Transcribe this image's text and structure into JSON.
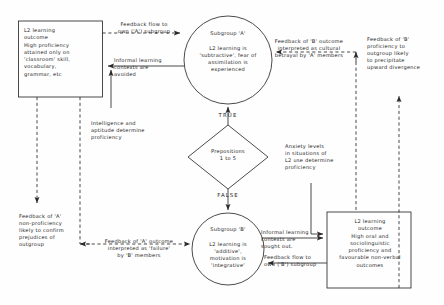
{
  "diagram": {
    "stroke_color": "#2a2a2a",
    "text_color": "#1d1d1d",
    "background": "#fefefe",
    "nodes": [
      {
        "id": "box-a-outcome",
        "shape": "rectangle",
        "name": "l2-learning-outcome-a-box",
        "text": "L2  learning\noutcome\nHigh proficiency\nattained only on\n'classroom' skill,\nvocabulary,\ngrammar, etc"
      },
      {
        "id": "circle-subgroup-a",
        "shape": "circle",
        "name": "subgroup-a-node",
        "text": "Subgroup 'A'\n\nL2  learning is\n'subtractive', fear of\nassimilation is\nexperienced"
      },
      {
        "id": "diamond-prepositions",
        "shape": "diamond",
        "name": "prepositions-decision-node",
        "text": "Prepositions\n1 to 5"
      },
      {
        "id": "circle-subgroup-b",
        "shape": "circle",
        "name": "subgroup-b-node",
        "text": "Subgroup 'B'\n\nL2 learning is\n'additive',\nmotivation is\n'integrative'"
      },
      {
        "id": "box-b-outcome",
        "shape": "rectangle",
        "name": "l2-learning-outcome-b-box",
        "text": "L2  learning\noutcome\nHigh oral and\nsociolinguistic\nproficiency  and\nfavourable non-verbal\noutcomes"
      }
    ],
    "decision_labels": {
      "true": "TRUE",
      "false": "FALSE"
    },
    "edge_labels": [
      {
        "id": "feedback-flow-a",
        "name": "edge-label-feedback-flow-a",
        "text": "Feedback flow to\nown ('A') subgroup"
      },
      {
        "id": "informal-avoided",
        "name": "edge-label-informal-learning-avoided",
        "text": "Informal learning\ncontexts are\navoided"
      },
      {
        "id": "intelligence-aptitude",
        "name": "edge-label-intelligence-aptitude",
        "text": "Intelligence and\naptitude determine\nproficiency"
      },
      {
        "id": "feedback-b-outcome",
        "name": "edge-label-feedback-b-outcome",
        "text": "Feedback of 'B' outcome\ninterpreted as cultural\nbetrayal by 'A' members"
      },
      {
        "id": "feedback-b-proficiency",
        "name": "edge-label-feedback-b-proficiency",
        "text": "Feedback of 'B'\nproficiency to\noutgroup likely\nto precipitate\nupward divergence"
      },
      {
        "id": "anxiety-levels",
        "name": "edge-label-anxiety-levels",
        "text": "Anxiety levels\nin situations of\nL2 use determine\nproficiency"
      },
      {
        "id": "feedback-a-nonproficiency",
        "name": "edge-label-feedback-a-nonproficiency",
        "text": "Feedback of 'A'\nnon-proficiency\nlikely to confirm\nprejudices of\noutgroup"
      },
      {
        "id": "feedback-a-outcome",
        "name": "edge-label-feedback-a-outcome",
        "text": "Feedback of 'A' outcome\ninterpreted as 'failure'\nby 'B' members"
      },
      {
        "id": "informal-sought",
        "name": "edge-label-informal-learning-sought",
        "text": "Informal learning\ncontexts are\nsought out."
      },
      {
        "id": "feedback-flow-b",
        "name": "edge-label-feedback-flow-b",
        "text": "Feedback  flow to\nown ('B') subgroup"
      }
    ]
  }
}
